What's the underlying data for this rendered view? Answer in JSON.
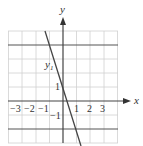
{
  "axes": {
    "x_label": "x",
    "y_label": "y",
    "x_ticks": [
      {
        "value": -3,
        "label": "−3"
      },
      {
        "value": -2,
        "label": "−2"
      },
      {
        "value": -1,
        "label": "−1"
      },
      {
        "value": 1,
        "label": "1"
      },
      {
        "value": 2,
        "label": "2"
      },
      {
        "value": 3,
        "label": "3"
      }
    ],
    "y_ticks": [
      {
        "value": 1,
        "label": "1"
      },
      {
        "value": -1,
        "label": "−1"
      }
    ],
    "x_range": [
      -4,
      4
    ],
    "y_range": [
      -3,
      5
    ]
  },
  "curves": {
    "y1": {
      "label": "y",
      "subscript": "1",
      "description": "steep decreasing line y = -3x + 1"
    },
    "h_top": {
      "description": "horizontal line y = 4"
    },
    "h_bottom": {
      "description": "horizontal line y = -2"
    }
  },
  "colors": {
    "grid": "#cfcfcf",
    "axis": "#444444",
    "line": "#444444"
  }
}
